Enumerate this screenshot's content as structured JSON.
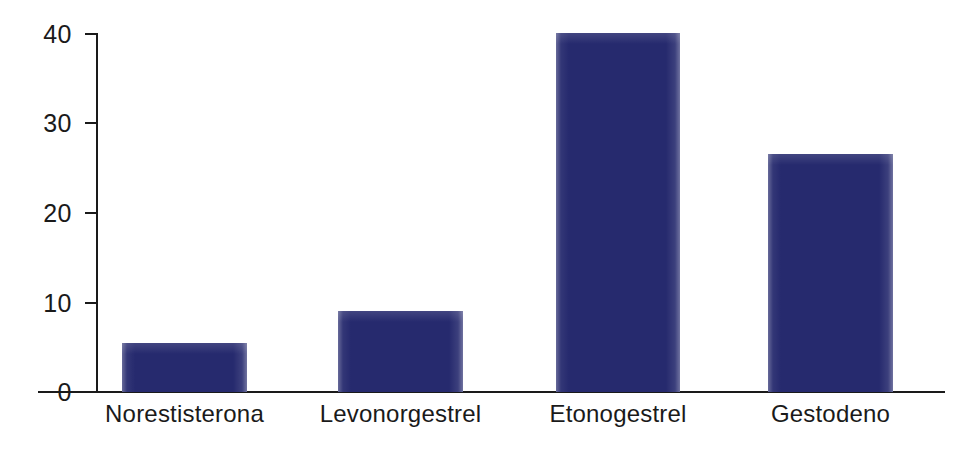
{
  "chart_data": {
    "type": "bar",
    "title": "",
    "subtitle": "",
    "xlabel": "",
    "ylabel": "",
    "categories": [
      "Norestisterona",
      "Levonorgestrel",
      "Etonogestrel",
      "Gestodeno"
    ],
    "values": [
      5.5,
      9,
      40,
      26.5
    ],
    "series": [
      {
        "name": "",
        "values": [
          5.5,
          9,
          40,
          26.5
        ]
      }
    ],
    "ylim": [
      0,
      40
    ],
    "yticks": [
      0,
      10,
      20,
      30,
      40
    ],
    "ytick_labels": [
      "0",
      "10",
      "20",
      "30",
      "40"
    ],
    "grid": false,
    "legend": null,
    "legend_position": "none",
    "bar_color": "#262a6e",
    "axis_color": "#1a1a1a",
    "background_color": "#ffffff",
    "annotations": []
  }
}
